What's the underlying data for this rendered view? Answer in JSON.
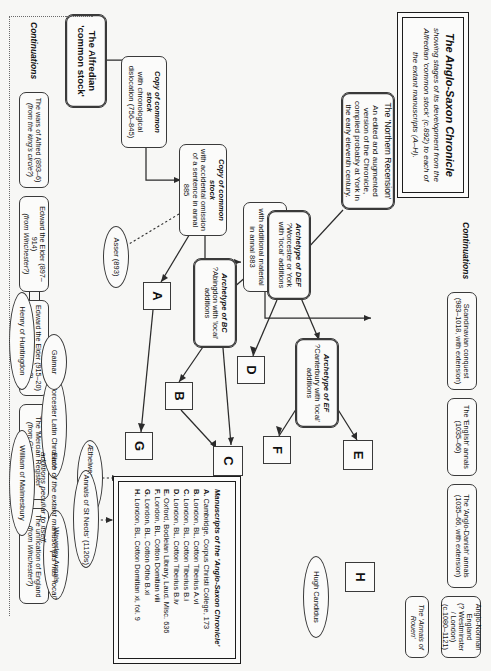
{
  "title_panel": {
    "heading": "The Anglo-Saxon Chronicle",
    "subheading": "showing stages of its development from the Alfredian 'common stock' (c.892) to each of the extant manuscripts (A–H)."
  },
  "root": {
    "label": "The Alfredian",
    "label2": "'common stock'"
  },
  "stages": [
    {
      "id": "chronological",
      "title": "Copy of common stock",
      "sub": "with chronological dislocation (756–845)"
    },
    {
      "id": "omission",
      "title": "Copy of common stock",
      "sub": "with accidental omission of a sentence in annal 885"
    },
    {
      "id": "additional",
      "title": "Copy of common stock",
      "sub": "with additional material in annal 883"
    },
    {
      "id": "archetype-bc",
      "title": "Archetype of BC",
      "sub": "?Abingdon with 'local' additions"
    },
    {
      "id": "archetype-def",
      "title": "Archetype of DEF",
      "sub": "?Worcester or York with 'local' additions"
    },
    {
      "id": "archetype-ef",
      "title": "Archetype of EF",
      "sub": "?Canterbury with 'local' additions"
    }
  ],
  "northern_recension": {
    "title": "The 'Northern Recension'",
    "sub": "An edited and augmented version of the Chronicle, compiled probably at York in the early eleventh century."
  },
  "continuations_left": {
    "label": "Continuations",
    "items": [
      {
        "main": "The wars of Alfred (893–6)",
        "sub": "(from the king's circle?)"
      },
      {
        "main": "Edward the Elder (897–914)",
        "sub": "(from Winchester?)"
      },
      {
        "main": "Edward the Elder (915–20)",
        "sub": "(from Winchester?)"
      },
      {
        "main": "The 'Mercian Register'",
        "sub": "(from Gloucester?)"
      },
      {
        "main": "The unification of England",
        "sub": "(from Winchester?)"
      }
    ]
  },
  "continuations_right": {
    "label": "Continuations",
    "items": [
      {
        "main": "Scandinavian conquest",
        "sub": "(983–1018, with extension)"
      },
      {
        "main": "The 'English' annals",
        "sub": "(1035–66)"
      },
      {
        "main": "The 'Anglo-Danish' annals",
        "sub": "(1035–66, with extension)"
      },
      {
        "main": "Anglo-Norman England",
        "sub": "(? Westminster / London) (c.1080–1121)"
      },
      {
        "main": "The 'Annals of Rouen'",
        "sub": ""
      }
    ]
  },
  "manuscript_sigla": [
    "A",
    "B",
    "C",
    "D",
    "E",
    "F",
    "G",
    "H"
  ],
  "derivatives": [
    {
      "id": "asser",
      "label": "Asser (893)"
    },
    {
      "id": "aethelweard",
      "label": "Æthelweard (c. 985)"
    },
    {
      "id": "stneots",
      "label": "'Annals of St Neots' (1120s)"
    },
    {
      "id": "worcester",
      "label": "Worcester Latin Chronicle"
    },
    {
      "id": "william",
      "label": "William of Malmesbury"
    },
    {
      "id": "henry",
      "label": "Henry of Huntingdon"
    },
    {
      "id": "gaimar",
      "label": "Gaimar"
    },
    {
      "id": "waverley",
      "label": "Waverley Annals"
    },
    {
      "id": "hugh",
      "label": "Hugh Candidus"
    }
  ],
  "note": "Each of the extant manuscripts has 'local' additions peculiar to itself.",
  "manuscripts_panel": {
    "title": "Manuscripts of the 'Anglo-Saxon Chronicle'",
    "entries": [
      {
        "sigil": "A.",
        "text": "Cambridge, Corpus Christi College, 173"
      },
      {
        "sigil": "B.",
        "text": "London, BL, Cotton Tiberius A.vi"
      },
      {
        "sigil": "C.",
        "text": "London, BL, Cotton Tiberius B.i"
      },
      {
        "sigil": "D.",
        "text": "London, BL, Cotton Tiberius B.iv"
      },
      {
        "sigil": "E.",
        "text": "Oxford, Bodleian Library, Laud. Misc. 636"
      },
      {
        "sigil": "F.",
        "text": "London, BL, Cotton Domitian viii"
      },
      {
        "sigil": "G.",
        "text": "London, BL, Cotton Otho B.xi"
      },
      {
        "sigil": "H.",
        "text": "London, BL, Cotton Domitian xi, fol. 9"
      }
    ]
  },
  "colors": {
    "background": "#f7f7f5",
    "stroke": "#2b2b2b",
    "node_fill": "#fbfbfa"
  }
}
